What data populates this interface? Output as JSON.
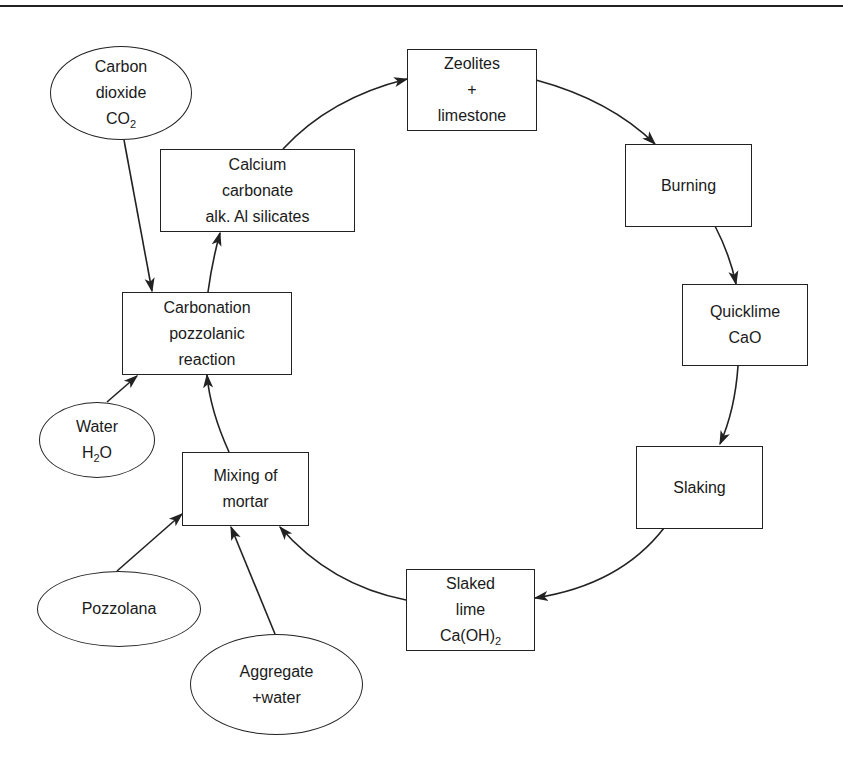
{
  "diagram": {
    "type": "cycle-flow",
    "colors": {
      "stroke": "#222222",
      "text": "#1a1a1a",
      "background": "#ffffff"
    },
    "nodes": {
      "zeolites": {
        "shape": "box",
        "lines": [
          "Zeolites",
          "+",
          "limestone"
        ]
      },
      "burning": {
        "shape": "box",
        "lines": [
          "Burning"
        ]
      },
      "quicklime": {
        "shape": "box",
        "lines": [
          "Quicklime",
          "CaO"
        ]
      },
      "slaking": {
        "shape": "box",
        "lines": [
          "Slaking"
        ]
      },
      "slaked_lime": {
        "shape": "box",
        "lines": [
          "Slaked",
          "lime",
          "Ca(OH)"
        ],
        "subscript": "2"
      },
      "mixing": {
        "shape": "box",
        "lines": [
          "Mixing of",
          "mortar"
        ]
      },
      "carbonation": {
        "shape": "box",
        "lines": [
          "Carbonation",
          "pozzolanic",
          "reaction"
        ]
      },
      "calcium_carbonate": {
        "shape": "box",
        "lines": [
          "Calcium",
          "carbonate",
          "alk. Al silicates"
        ]
      },
      "co2": {
        "shape": "ellipse",
        "lines": [
          "Carbon",
          "dioxide",
          "CO"
        ],
        "subscript": "2"
      },
      "water": {
        "shape": "ellipse",
        "lines": [
          "Water",
          "H",
          "O"
        ],
        "subscript": "2"
      },
      "pozzolana": {
        "shape": "ellipse",
        "lines": [
          "Pozzolana"
        ]
      },
      "aggregate": {
        "shape": "ellipse",
        "lines": [
          "Aggregate",
          "+water"
        ]
      }
    },
    "edges": [
      {
        "from": "calcium_carbonate",
        "to": "zeolites"
      },
      {
        "from": "zeolites",
        "to": "burning"
      },
      {
        "from": "burning",
        "to": "quicklime"
      },
      {
        "from": "quicklime",
        "to": "slaking"
      },
      {
        "from": "slaking",
        "to": "slaked_lime"
      },
      {
        "from": "slaked_lime",
        "to": "mixing"
      },
      {
        "from": "mixing",
        "to": "carbonation"
      },
      {
        "from": "carbonation",
        "to": "calcium_carbonate"
      },
      {
        "from": "co2",
        "to": "carbonation"
      },
      {
        "from": "water",
        "to": "carbonation"
      },
      {
        "from": "pozzolana",
        "to": "mixing"
      },
      {
        "from": "aggregate",
        "to": "mixing"
      }
    ]
  }
}
